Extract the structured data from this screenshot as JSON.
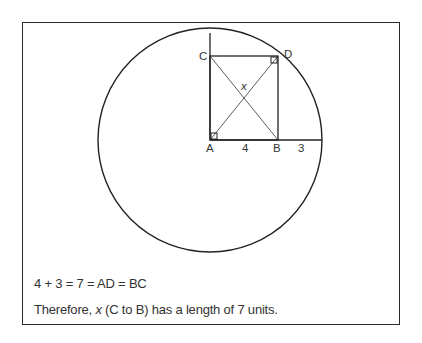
{
  "diagram": {
    "points": {
      "A": "A",
      "B": "B",
      "C": "C",
      "D": "D"
    },
    "segment_labels": {
      "AB": "4",
      "B_to_edge": "3",
      "diagonal": "x"
    },
    "colors": {
      "stroke": "#222222",
      "text": "#333333",
      "background": "#ffffff"
    }
  },
  "caption": {
    "line1": "4 + 3 = 7 = AD = BC",
    "line2_prefix": "Therefore, ",
    "line2_var": "x",
    "line2_suffix": " (C to B) has a length of 7 units."
  }
}
